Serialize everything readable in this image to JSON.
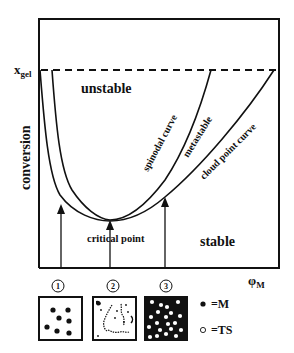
{
  "diagram": {
    "y_axis_label": "conversion",
    "y_tick_label": "x",
    "y_tick_sub": "gel",
    "x_axis_label": "φ",
    "x_axis_sub": "M",
    "regions": {
      "unstable": "unstable",
      "stable": "stable",
      "metastable": "metastable"
    },
    "curves": {
      "spinodal": "spinodal curve",
      "cloud_point": "cloud point curve"
    },
    "annotation": "critical point",
    "markers": [
      "1",
      "2",
      "3"
    ],
    "legend": {
      "filled": "=M",
      "hollow": "=TS"
    },
    "colors": {
      "line": "#111111",
      "background": "#ffffff"
    }
  }
}
